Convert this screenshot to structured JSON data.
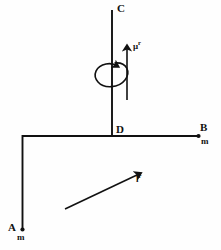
{
  "figure": {
    "background_color": "#fefefe",
    "stroke_color": "#111111",
    "width": 221,
    "height": 250
  },
  "nodes": {
    "c": {
      "label": "C",
      "x": 112,
      "y": 10
    },
    "d": {
      "label": "D",
      "x": 112,
      "y": 136
    },
    "b": {
      "label": "B",
      "x": 197,
      "y": 136
    },
    "a": {
      "label": "A",
      "x": 22,
      "y": 229
    }
  },
  "mass_markers": [
    {
      "label": "m",
      "at_node": "B"
    },
    {
      "label": "m",
      "at_node": "A"
    }
  ],
  "vectors": [
    {
      "name": "angular-velocity-vector",
      "label": "μ",
      "superscript": "r",
      "direction": "up",
      "from": {
        "x": 127,
        "y": 100
      },
      "to": {
        "x": 127,
        "y": 47
      }
    },
    {
      "name": "impulse-vector",
      "label": "l",
      "superscript": "r",
      "direction": "up-right",
      "from": {
        "x": 65,
        "y": 209
      },
      "to": {
        "x": 139,
        "y": 174
      }
    }
  ],
  "rotation_indicator": {
    "name": "spin-loop",
    "description": "elliptical curved arrow encircling the vertical rod CD",
    "center": {
      "x": 112,
      "y": 73
    },
    "rx": 16,
    "ry": 11
  },
  "members": [
    {
      "name": "rod-CD",
      "from": "C",
      "to": "D",
      "orientation": "vertical"
    },
    {
      "name": "rod-DB",
      "from": "D",
      "to": "B",
      "orientation": "horizontal"
    },
    {
      "name": "rod-D-corner",
      "from": "D",
      "to": "corner",
      "orientation": "horizontal"
    },
    {
      "name": "rod-corner-A",
      "from": "corner",
      "to": "A",
      "orientation": "vertical"
    }
  ]
}
